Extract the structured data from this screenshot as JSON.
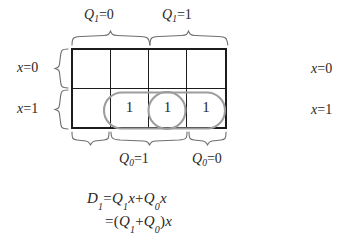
{
  "figure": {
    "type": "karnaugh-map",
    "title_row_top": [
      {
        "var": "Q",
        "sub": "1",
        "eq": "=",
        "value": "0"
      },
      {
        "var": "Q",
        "sub": "1",
        "eq": "=",
        "value": "1"
      }
    ],
    "row_labels": [
      {
        "var": "x",
        "eq": "=",
        "value": "0"
      },
      {
        "var": "x",
        "eq": "=",
        "value": "1"
      }
    ],
    "bottom_labels": [
      {
        "var": "Q",
        "sub": "0",
        "eq": "=",
        "value": "1"
      },
      {
        "var": "Q",
        "sub": "0",
        "eq": "=",
        "value": "0"
      }
    ],
    "grid": {
      "rows": 2,
      "cols": 4,
      "cells": [
        [
          "",
          "",
          "",
          ""
        ],
        [
          "",
          "1",
          "1",
          "1"
        ]
      ]
    },
    "groupings": [
      {
        "name": "outer-group",
        "cells": "row2-col2-col3-col4",
        "shape": "rounded-rect"
      },
      {
        "name": "inner-group",
        "cells": "row2-col3",
        "shape": "circle"
      }
    ],
    "equations": [
      {
        "lhs": "D",
        "lhs_sub": "1",
        "op": "=",
        "rhs": "Q₁x+Q₀x"
      },
      {
        "lhs": "",
        "lhs_sub": "",
        "op": "=",
        "rhs": "( Q₁+Q₀ ) x"
      }
    ],
    "equation_lines": {
      "line1_d": "D",
      "line1_d_sub": "1",
      "line1_eq": "=",
      "line1_q1": "Q",
      "line1_q1_sub": "1",
      "line1_x1": "x",
      "line1_plus": "+",
      "line1_q0": "Q",
      "line1_q0_sub": "0",
      "line1_x2": "x",
      "line2_eq": "=",
      "line2_open": "(",
      "line2_q1": "Q",
      "line2_q1_sub": "1",
      "line2_plus": "+",
      "line2_q0": "Q",
      "line2_q0_sub": "0",
      "line2_close": ")",
      "line2_x": "x"
    },
    "clipped_neighbor": {
      "row1": {
        "var": "x",
        "eq": "=",
        "value": "0"
      },
      "row2": {
        "var": "x",
        "eq": "=",
        "value": "1"
      }
    },
    "colors": {
      "ink": "#231f20",
      "grid_line": "#1c1c1c",
      "grouping": "#9b9b9b",
      "brace": "#6e6e6e",
      "background": "#ffffff"
    }
  }
}
